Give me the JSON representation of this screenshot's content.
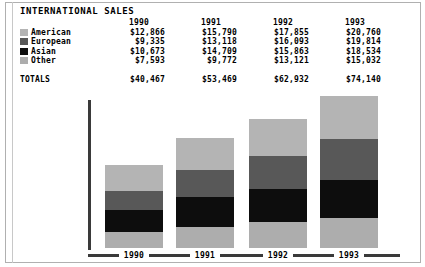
{
  "title": "INTERNATIONAL SALES",
  "colors": {
    "american": "#b4b4b4",
    "european": "#585858",
    "asian": "#0d0d0d",
    "other": "#adadad",
    "axis": "#3a3a3a",
    "frame": "#b0b0b0",
    "background": "#ffffff",
    "text": "#000000"
  },
  "table": {
    "year_headers": [
      "1990",
      "1991",
      "1992",
      "1993"
    ],
    "rows": [
      {
        "label": "American",
        "swatch": "american",
        "values": [
          "$12,866",
          "$15,790",
          "$17,855",
          "$20,760"
        ]
      },
      {
        "label": "European",
        "swatch": "european",
        "values": [
          "$9,335",
          "$13,118",
          "$16,093",
          "$19,814"
        ]
      },
      {
        "label": "Asian",
        "swatch": "asian",
        "values": [
          "$10,673",
          "$14,709",
          "$15,863",
          "$18,534"
        ]
      },
      {
        "label": "Other",
        "swatch": "other",
        "values": [
          "$7,593",
          "$9,772",
          "$13,121",
          "$15,032"
        ]
      }
    ],
    "totals_label": "TOTALS",
    "totals": [
      "$40,467",
      "$53,469",
      "$62,932",
      "$74,140"
    ]
  },
  "chart_data": {
    "type": "bar",
    "subtype": "stacked",
    "title": "INTERNATIONAL SALES",
    "xlabel": "",
    "ylabel": "",
    "categories": [
      "1990",
      "1991",
      "1992",
      "1993"
    ],
    "series": [
      {
        "name": "Other",
        "values": [
          7593,
          9772,
          13121,
          15032
        ],
        "color": "#adadad"
      },
      {
        "name": "Asian",
        "values": [
          10673,
          14709,
          15863,
          18534
        ],
        "color": "#0d0d0d"
      },
      {
        "name": "European",
        "values": [
          9335,
          13118,
          16093,
          19814
        ],
        "color": "#585858"
      },
      {
        "name": "American",
        "values": [
          12866,
          15790,
          17855,
          20760
        ],
        "color": "#b4b4b4"
      }
    ],
    "stack_order_bottom_to_top": [
      "Other",
      "Asian",
      "European",
      "American"
    ],
    "totals": [
      40467,
      53469,
      62932,
      74140
    ],
    "ylim": [
      0,
      80000
    ],
    "grid": false,
    "legend_position": "table-left"
  }
}
